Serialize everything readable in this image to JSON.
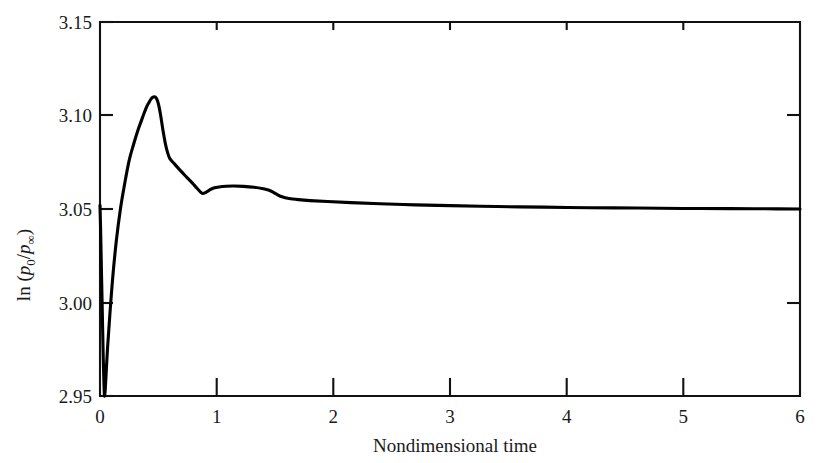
{
  "chart_data": {
    "type": "line",
    "title": "",
    "xlabel": "Nondimensional time",
    "ylabel": "ln (p0/p∞)",
    "ylabel_parts": {
      "prefix": "ln (",
      "p_main": "p",
      "p_sub": "0",
      "slash": "/",
      "p_main2": "p",
      "p_sub2": "∞",
      "suffix": ")"
    },
    "xlim": [
      0,
      6
    ],
    "ylim": [
      2.95,
      3.15
    ],
    "xticks": [
      0,
      1,
      2,
      3,
      4,
      5,
      6
    ],
    "xtick_labels": [
      "0",
      "1",
      "2",
      "3",
      "4",
      "5",
      "6"
    ],
    "yticks": [
      2.95,
      3.0,
      3.05,
      3.1,
      3.15
    ],
    "ytick_labels": [
      "2.95",
      "3.00",
      "3.05",
      "3.10",
      "3.15"
    ],
    "grid": false,
    "legend": null,
    "line_color": "#000000",
    "series": [
      {
        "name": "ln(p0/pinf)",
        "x": [
          0.0,
          0.005,
          0.012,
          0.02,
          0.028,
          0.034,
          0.04,
          0.05,
          0.065,
          0.085,
          0.11,
          0.14,
          0.175,
          0.21,
          0.25,
          0.29,
          0.33,
          0.365,
          0.395,
          0.42,
          0.44,
          0.455,
          0.468,
          0.48,
          0.492,
          0.505,
          0.52,
          0.54,
          0.56,
          0.58,
          0.6,
          0.64,
          0.69,
          0.74,
          0.79,
          0.83,
          0.86,
          0.88,
          0.905,
          0.935,
          0.975,
          1.02,
          1.08,
          1.15,
          1.23,
          1.32,
          1.4,
          1.45,
          1.49,
          1.52,
          1.56,
          1.62,
          1.7,
          1.8,
          1.95,
          2.15,
          2.4,
          2.7,
          3.0,
          3.4,
          3.8,
          4.2,
          4.6,
          5.0,
          5.4,
          5.7,
          6.0
        ],
        "y": [
          3.052,
          3.04,
          3.018,
          2.994,
          2.97,
          2.956,
          2.95,
          2.959,
          2.976,
          2.994,
          3.014,
          3.033,
          3.05,
          3.063,
          3.076,
          3.085,
          3.093,
          3.099,
          3.104,
          3.107,
          3.109,
          3.1098,
          3.11,
          3.1095,
          3.108,
          3.105,
          3.1,
          3.092,
          3.085,
          3.08,
          3.0768,
          3.074,
          3.0705,
          3.0672,
          3.064,
          3.0612,
          3.0592,
          3.0583,
          3.0588,
          3.06,
          3.0612,
          3.0618,
          3.0622,
          3.0623,
          3.0621,
          3.0616,
          3.0608,
          3.06,
          3.0588,
          3.0577,
          3.0565,
          3.0556,
          3.055,
          3.0545,
          3.054,
          3.0534,
          3.0528,
          3.0522,
          3.0518,
          3.0513,
          3.051,
          3.0507,
          3.0505,
          3.0503,
          3.0502,
          3.0501,
          3.05
        ]
      }
    ],
    "annotations": {
      "initial_value": 3.052,
      "minimum": {
        "t": 0.04,
        "value": 2.95
      },
      "peak": {
        "t": 0.468,
        "value": 3.11
      },
      "shoulder": {
        "t": 0.6,
        "value": 3.077
      },
      "local_min": {
        "t": 0.88,
        "value": 3.058
      },
      "secondary_plateau": {
        "t": 1.15,
        "value": 3.062
      },
      "asymptote": {
        "t": 6.0,
        "value": 3.05
      }
    }
  },
  "axes": {
    "left_spine": true,
    "right_spine": true,
    "top_spine": true,
    "bottom_spine": true,
    "tick_direction": "in"
  }
}
